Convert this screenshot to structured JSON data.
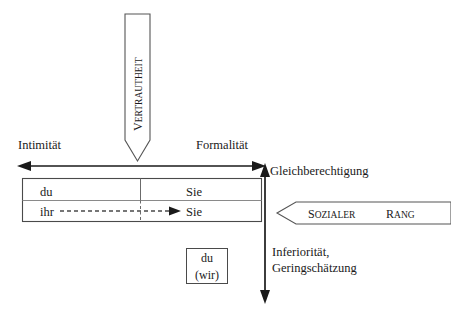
{
  "diagram": {
    "title_axes": {
      "horizontal_left": "Intimität",
      "horizontal_right": "Formalität",
      "vertical_top": "Gleichberechtigung",
      "vertical_bottom_line1": "Inferiorität,",
      "vertical_bottom_line2": "Geringschätzung"
    },
    "banners": {
      "vertical_arrow_label": "VERTRAUTHEIT",
      "vertical_arrow_label_first": "V",
      "vertical_arrow_label_rest": "ERTRAUTHEIT",
      "horizontal_arrow_label": "SOZIALER RANG",
      "horizontal_arrow_word1_first": "S",
      "horizontal_arrow_word1_rest": "OZIALER",
      "horizontal_arrow_word2_first": "R",
      "horizontal_arrow_word2_rest": "ANG"
    },
    "table": {
      "rows": [
        {
          "left": "du",
          "right": "Sie"
        },
        {
          "left": "ihr",
          "right": "Sie"
        }
      ]
    },
    "lower_box": {
      "line1": "du",
      "line2": "(wir)"
    },
    "colors": {
      "stroke": "#1a1a1a",
      "light_stroke": "#6b6b6b",
      "background": "#ffffff",
      "text": "#1a1a1a"
    }
  }
}
